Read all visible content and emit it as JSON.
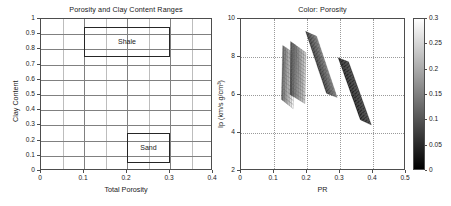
{
  "figure": {
    "width": 451,
    "height": 206,
    "background": "#ffffff"
  },
  "chart_data": [
    {
      "id": "porosity-clay-ranges",
      "type": "bar",
      "render_as": "annotated-region-rectangles",
      "title": "Porosity and Clay Content Ranges",
      "xlabel": "Total Porosity",
      "ylabel": "Clay Content",
      "xlim": [
        0,
        0.4
      ],
      "ylim": [
        0,
        1
      ],
      "xticks": [
        0,
        0.1,
        0.2,
        0.3,
        0.4
      ],
      "xticklabels": [
        "0",
        "0.1",
        "0.2",
        "0.3",
        "0.4"
      ],
      "yticks": [
        0,
        0.1,
        0.2,
        0.3,
        0.4,
        0.5,
        0.6,
        0.7,
        0.8,
        0.9,
        1
      ],
      "yticklabels": [
        "0",
        "0.1",
        "0.2",
        "0.3",
        "0.4",
        "0.5",
        "0.6",
        "0.7",
        "0.8",
        "0.9",
        "1"
      ],
      "grid": true,
      "grid_x_step": 0.05,
      "grid_y_step": 0.1,
      "legend": null,
      "regions": [
        {
          "label": "Shale",
          "x0": 0.1,
          "x1": 0.3,
          "y0": 0.75,
          "y1": 0.95,
          "edgecolor": "#262626",
          "facecolor": "none"
        },
        {
          "label": "Sand",
          "x0": 0.2,
          "x1": 0.3,
          "y0": 0.05,
          "y1": 0.25,
          "edgecolor": "#262626",
          "facecolor": "none"
        }
      ]
    },
    {
      "id": "color-porosity",
      "type": "scatter",
      "render_as": "mesh-surface-patches",
      "title": "Color: Porosity",
      "xlabel": "PR",
      "ylabel": "Ip (km/s g/cm³)",
      "xlim": [
        0,
        0.5
      ],
      "ylim": [
        2,
        10
      ],
      "xticks": [
        0,
        0.1,
        0.2,
        0.3,
        0.4,
        0.5
      ],
      "xticklabels": [
        "0",
        "0.1",
        "0.2",
        "0.3",
        "0.4",
        "0.5"
      ],
      "yticks": [
        2,
        4,
        6,
        8,
        10
      ],
      "yticklabels": [
        "2",
        "4",
        "6",
        "8",
        "10"
      ],
      "grid": true,
      "grid_style": "dotted",
      "legend": null,
      "colorbar": {
        "label": "Porosity",
        "vmin": 0,
        "vmax": 0.3,
        "ticks": [
          0,
          0.05,
          0.1,
          0.15,
          0.2,
          0.25,
          0.3
        ],
        "ticklabels": [
          "0",
          "0.05",
          "0.1",
          "0.15",
          "0.2",
          "0.25",
          "0.3"
        ],
        "colormap": "gray",
        "low_color": "#000000",
        "high_color": "#ffffff",
        "position": "right"
      },
      "patches": [
        {
          "name": "patch-1",
          "x_range": [
            0.125,
            0.165
          ],
          "y_range": [
            5.6,
            8.7
          ],
          "mean_color_value": 0.23,
          "corners": [
            [
              0.128,
              8.7
            ],
            [
              0.165,
              8.3
            ],
            [
              0.16,
              5.6
            ],
            [
              0.124,
              6.05
            ]
          ]
        },
        {
          "name": "patch-2",
          "x_range": [
            0.15,
            0.2
          ],
          "y_range": [
            5.8,
            8.9
          ],
          "mean_color_value": 0.18,
          "corners": [
            [
              0.152,
              8.9
            ],
            [
              0.199,
              8.35
            ],
            [
              0.196,
              5.85
            ],
            [
              0.15,
              6.3
            ]
          ]
        },
        {
          "name": "patch-3",
          "x_range": [
            0.195,
            0.295
          ],
          "y_range": [
            6.1,
            9.4
          ],
          "mean_color_value": 0.12,
          "corners": [
            [
              0.198,
              9.4
            ],
            [
              0.232,
              9.15
            ],
            [
              0.295,
              6.15
            ],
            [
              0.262,
              6.35
            ]
          ]
        },
        {
          "name": "patch-4",
          "x_range": [
            0.295,
            0.4
          ],
          "y_range": [
            4.8,
            8.1
          ],
          "mean_color_value": 0.05,
          "corners": [
            [
              0.298,
              8.1
            ],
            [
              0.33,
              7.9
            ],
            [
              0.4,
              4.8
            ],
            [
              0.366,
              5.05
            ]
          ]
        }
      ]
    }
  ]
}
